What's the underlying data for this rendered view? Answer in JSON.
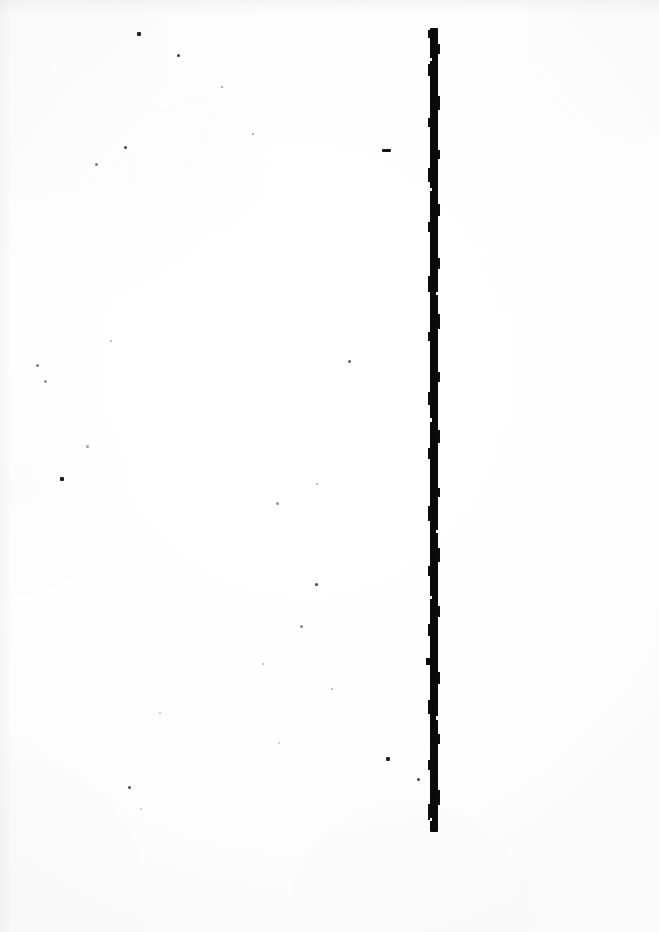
{
  "page": {
    "kind": "scanned-blank-page",
    "caption": "",
    "width_px": 659,
    "height_px": 932,
    "background_color": "#ffffff",
    "ink_color": "#0a0a0a"
  },
  "rule": {
    "name": "vertical-rule",
    "orientation": "vertical",
    "x_px": 429,
    "top_px": 28,
    "bottom_px": 832,
    "length_px": 804,
    "thickness_px": 9,
    "color": "#0a0a0a"
  },
  "marks": {
    "dash": {
      "x": 382,
      "y": 149,
      "width": 9,
      "height": 3
    },
    "specks": [
      {
        "x": 137,
        "y": 32,
        "size": 4,
        "opacity": 0.92
      },
      {
        "x": 177,
        "y": 54,
        "size": 3,
        "opacity": 0.85
      },
      {
        "x": 221,
        "y": 86,
        "size": 2,
        "opacity": 0.45
      },
      {
        "x": 252,
        "y": 133,
        "size": 2,
        "opacity": 0.4
      },
      {
        "x": 124,
        "y": 146,
        "size": 3,
        "opacity": 0.8
      },
      {
        "x": 95,
        "y": 163,
        "size": 3,
        "opacity": 0.55
      },
      {
        "x": 36,
        "y": 364,
        "size": 3,
        "opacity": 0.55
      },
      {
        "x": 44,
        "y": 380,
        "size": 3,
        "opacity": 0.45
      },
      {
        "x": 348,
        "y": 360,
        "size": 3,
        "opacity": 0.65
      },
      {
        "x": 110,
        "y": 340,
        "size": 2,
        "opacity": 0.35
      },
      {
        "x": 86,
        "y": 445,
        "size": 3,
        "opacity": 0.4
      },
      {
        "x": 60,
        "y": 477,
        "size": 4,
        "opacity": 0.95
      },
      {
        "x": 316,
        "y": 483,
        "size": 2,
        "opacity": 0.35
      },
      {
        "x": 276,
        "y": 502,
        "size": 3,
        "opacity": 0.45
      },
      {
        "x": 315,
        "y": 583,
        "size": 3,
        "opacity": 0.8
      },
      {
        "x": 300,
        "y": 625,
        "size": 3,
        "opacity": 0.5
      },
      {
        "x": 262,
        "y": 663,
        "size": 2,
        "opacity": 0.3
      },
      {
        "x": 331,
        "y": 688,
        "size": 2,
        "opacity": 0.35
      },
      {
        "x": 159,
        "y": 712,
        "size": 2,
        "opacity": 0.25
      },
      {
        "x": 278,
        "y": 742,
        "size": 2,
        "opacity": 0.25
      },
      {
        "x": 386,
        "y": 757,
        "size": 4,
        "opacity": 0.92
      },
      {
        "x": 417,
        "y": 778,
        "size": 3,
        "opacity": 0.8
      },
      {
        "x": 128,
        "y": 786,
        "size": 3,
        "opacity": 0.75
      },
      {
        "x": 140,
        "y": 808,
        "size": 2,
        "opacity": 0.25
      }
    ]
  }
}
